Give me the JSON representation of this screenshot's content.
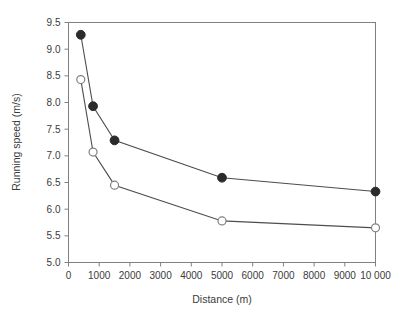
{
  "chart_data": {
    "type": "line",
    "title": "",
    "xlabel": "Distance (m)",
    "ylabel": "Running speed (m/s)",
    "xlim": [
      0,
      10000
    ],
    "ylim": [
      5.0,
      9.5
    ],
    "grid": false,
    "legend": "none",
    "x_ticks": [
      0,
      1000,
      2000,
      3000,
      4000,
      5000,
      6000,
      7000,
      8000,
      9000,
      10000
    ],
    "x_tick_labels": [
      "0",
      "1000",
      "2000",
      "3000",
      "4000",
      "5000",
      "6000",
      "7000",
      "8000",
      "9000",
      "10 000"
    ],
    "y_ticks": [
      5.0,
      5.5,
      6.0,
      6.5,
      7.0,
      7.5,
      8.0,
      8.5,
      9.0,
      9.5
    ],
    "y_tick_labels": [
      "5.0",
      "5.5",
      "6.0",
      "6.5",
      "7.0",
      "7.5",
      "8.0",
      "8.5",
      "9.0",
      "9.5"
    ],
    "x": [
      400,
      800,
      1500,
      5000,
      10000
    ],
    "series": [
      {
        "name": "filled-series",
        "marker": "filled-circle",
        "color": "#2b2b2b",
        "values": [
          9.27,
          7.93,
          7.29,
          6.59,
          6.33
        ]
      },
      {
        "name": "open-series",
        "marker": "open-circle",
        "color": "#808080",
        "values": [
          8.43,
          7.07,
          6.45,
          5.78,
          5.65
        ]
      }
    ]
  },
  "figure": {
    "background_color": "#ffffff",
    "frame_color": "#808080",
    "text_color": "#3b3b3b"
  }
}
